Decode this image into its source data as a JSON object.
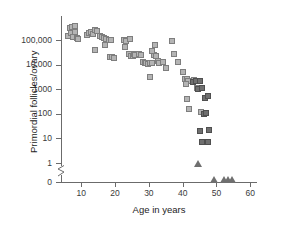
{
  "chart_data": {
    "type": "scatter",
    "title": "",
    "xlabel": "Age in years",
    "ylabel": "Primordial follicles/ovary",
    "xlim": [
      4,
      62
    ],
    "ylim_log": [
      1,
      1000000
    ],
    "xticks": [
      10,
      20,
      30,
      40,
      50,
      60
    ],
    "xtick_labels": [
      "10",
      "20",
      "30",
      "40",
      "50",
      "60"
    ],
    "ytick_labels": [
      "100,000",
      "10,000",
      "1000",
      "100",
      "10",
      "1",
      "0"
    ],
    "yticks": [
      100000,
      10000,
      1000,
      100,
      10,
      1,
      0
    ],
    "yscale": "log",
    "axis_break": true,
    "grid": false,
    "legend": "none",
    "series": [
      {
        "name": "light-squares",
        "marker": "square",
        "color": "#b4b4b4",
        "edge_color": "#7e7e7e",
        "points": [
          [
            6.2,
            140000
          ],
          [
            6.6,
            310000
          ],
          [
            7.0,
            185000
          ],
          [
            7.4,
            330000
          ],
          [
            7.6,
            130000
          ],
          [
            8.0,
            215000
          ],
          [
            8.2,
            360000
          ],
          [
            8.6,
            125000
          ],
          [
            9.0,
            115000
          ],
          [
            11.6,
            160000
          ],
          [
            12.2,
            185000
          ],
          [
            12.8,
            205000
          ],
          [
            13.4,
            175000
          ],
          [
            14.0,
            245000
          ],
          [
            14.6,
            230000
          ],
          [
            14.2,
            41000
          ],
          [
            15.4,
            150000
          ],
          [
            16.0,
            130000
          ],
          [
            16.6,
            120000
          ],
          [
            17.2,
            105000
          ],
          [
            17.0,
            65000
          ],
          [
            18.2,
            98000
          ],
          [
            18.8,
            96000
          ],
          [
            18.4,
            21000
          ],
          [
            19.0,
            19500
          ],
          [
            19.6,
            19000
          ],
          [
            22.6,
            100000
          ],
          [
            23.2,
            92000
          ],
          [
            23.0,
            50000
          ],
          [
            24.4,
            108000
          ],
          [
            24.0,
            28000
          ],
          [
            24.8,
            23000
          ],
          [
            25.2,
            21500
          ],
          [
            25.6,
            27000
          ],
          [
            26.4,
            26000
          ],
          [
            26.0,
            24500
          ],
          [
            27.2,
            27000
          ],
          [
            27.8,
            25500
          ],
          [
            28.2,
            12500
          ],
          [
            28.8,
            11500
          ],
          [
            29.2,
            11800
          ],
          [
            29.8,
            11000
          ],
          [
            30.2,
            11500
          ],
          [
            30.8,
            12000
          ],
          [
            30.4,
            3100
          ],
          [
            31.4,
            24000
          ],
          [
            31.0,
            35000
          ],
          [
            31.8,
            65000
          ],
          [
            32.2,
            22000
          ],
          [
            32.6,
            14500
          ],
          [
            33.0,
            12000
          ],
          [
            34.2,
            12500
          ],
          [
            35.0,
            7000
          ],
          [
            36.8,
            88000
          ],
          [
            37.4,
            26500
          ],
          [
            38.6,
            12500
          ],
          [
            40.2,
            4800
          ],
          [
            40.8,
            2700
          ],
          [
            41.2,
            2500
          ],
          [
            41.6,
            2100
          ],
          [
            41.0,
            1700
          ],
          [
            41.4,
            390
          ],
          [
            42.0,
            150
          ],
          [
            43.4,
            2400
          ],
          [
            44.2,
            1100
          ],
          [
            45.4,
            120
          ]
        ]
      },
      {
        "name": "dark-squares",
        "marker": "square",
        "color": "#6f6f6f",
        "edge_color": "#4f4f4f",
        "points": [
          [
            43.0,
            2000
          ],
          [
            44.0,
            2200
          ],
          [
            45.0,
            2100
          ],
          [
            44.6,
            1050
          ],
          [
            45.8,
            1150
          ],
          [
            46.6,
            440
          ],
          [
            46.2,
            95
          ],
          [
            47.4,
            530
          ],
          [
            47.0,
            110
          ],
          [
            45.2,
            20
          ],
          [
            47.8,
            22
          ],
          [
            45.6,
            7
          ],
          [
            47.6,
            7
          ]
        ]
      },
      {
        "name": "triangles-zero",
        "marker": "triangle",
        "color": "#6f6f6f",
        "points": [
          [
            44.4,
            0.75
          ],
          [
            49.3,
            0.0
          ],
          [
            52.3,
            0.0
          ],
          [
            53.4,
            0.0
          ],
          [
            54.7,
            0.0
          ]
        ]
      }
    ]
  },
  "axes": {
    "y_title": "Primordial follicles/ovary",
    "x_title": "Age in years",
    "y_tick_labels": [
      "100,000",
      "10,000",
      "1000",
      "100",
      "10",
      "1",
      "0"
    ],
    "x_tick_labels": [
      "10",
      "20",
      "30",
      "40",
      "50",
      "60"
    ]
  },
  "colors": {
    "axis": "#6b6b6b",
    "text": "#1d1d1d",
    "marker_light": "#b4b4b4",
    "marker_dark": "#6f6f6f",
    "background": "#ffffff"
  }
}
